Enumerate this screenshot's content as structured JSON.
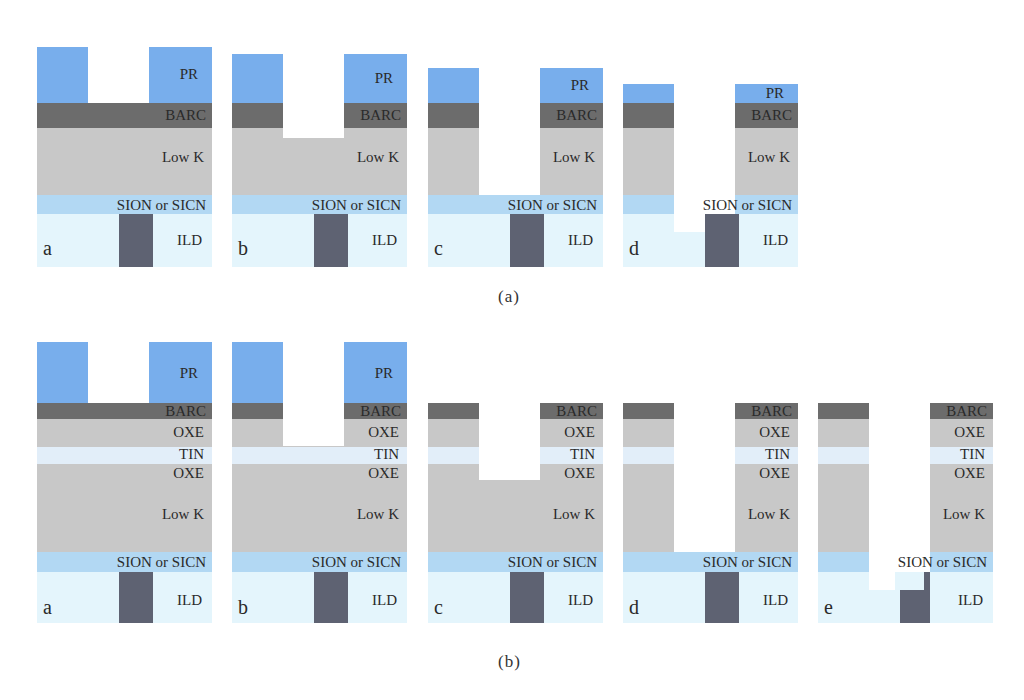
{
  "colors": {
    "PR": "#78aeec",
    "BARC": "#6c6c6c",
    "LowK_OXE": "#c8c8c8",
    "TIN": "#e2eef9",
    "SION_SICN": "#b2d8f3",
    "ILD": "#e4f5fc",
    "via_metal": "#5e6272",
    "text": "#2a2a2a"
  },
  "layer_names": {
    "pr": "PR",
    "barc": "BARC",
    "oxe": "OXE",
    "tin": "TIN",
    "lowk": "Low K",
    "sion": "SION or SICN",
    "ild": "ILD"
  },
  "figure_a": {
    "caption": "(a)",
    "panels": [
      {
        "letter": "a"
      },
      {
        "letter": "b"
      },
      {
        "letter": "c"
      },
      {
        "letter": "d"
      }
    ]
  },
  "figure_b": {
    "caption": "(b)",
    "panels": [
      {
        "letter": "a"
      },
      {
        "letter": "b"
      },
      {
        "letter": "c"
      },
      {
        "letter": "d"
      },
      {
        "letter": "e"
      }
    ]
  }
}
